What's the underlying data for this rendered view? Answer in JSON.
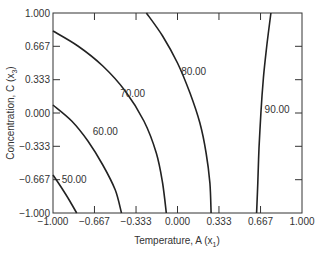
{
  "chart_data": {
    "type": "contour",
    "title": "",
    "xlabel": "Temperature, A (x",
    "xlabel_sub": "1",
    "xlabel_end": ")",
    "ylabel": "Concentration, C (x",
    "ylabel_sub": "3",
    "ylabel_end": ")",
    "xlim": [
      -1.0,
      1.0
    ],
    "ylim": [
      -1.0,
      1.0
    ],
    "x_ticks": [
      -1.0,
      -0.667,
      -0.333,
      0.0,
      0.333,
      0.667,
      1.0
    ],
    "x_tick_labels": [
      "−1.000",
      "−0.667",
      "−0.333",
      "0.000",
      "0.333",
      "0.667",
      "1.000"
    ],
    "y_ticks": [
      -1.0,
      -0.667,
      -0.333,
      0.0,
      0.333,
      0.667,
      1.0
    ],
    "y_tick_labels": [
      "−1.000",
      "−0.667",
      "−0.333",
      "0.000",
      "0.333",
      "0.667",
      "1.000"
    ],
    "grid": false,
    "contours": [
      {
        "level": 50,
        "label": "50.00",
        "points": [
          [
            -1.0,
            -0.62
          ],
          [
            -0.93,
            -0.75
          ],
          [
            -0.87,
            -0.87
          ],
          [
            -0.81,
            -1.0
          ]
        ],
        "label_pos": [
          -0.83,
          -0.66
        ]
      },
      {
        "level": 60,
        "label": "60.00",
        "points": [
          [
            -1.0,
            0.08
          ],
          [
            -0.85,
            -0.08
          ],
          [
            -0.72,
            -0.28
          ],
          [
            -0.6,
            -0.52
          ],
          [
            -0.5,
            -0.77
          ],
          [
            -0.45,
            -1.0
          ]
        ],
        "label_pos": [
          -0.58,
          -0.18
        ]
      },
      {
        "level": 70,
        "label": "70.00",
        "points": [
          [
            -1.0,
            0.82
          ],
          [
            -0.8,
            0.67
          ],
          [
            -0.6,
            0.47
          ],
          [
            -0.42,
            0.22
          ],
          [
            -0.27,
            -0.08
          ],
          [
            -0.17,
            -0.4
          ],
          [
            -0.12,
            -0.7
          ],
          [
            -0.09,
            -1.0
          ]
        ],
        "label_pos": [
          -0.36,
          0.2
        ]
      },
      {
        "level": 80,
        "label": "80.00",
        "points": [
          [
            -0.25,
            1.0
          ],
          [
            -0.12,
            0.77
          ],
          [
            0.0,
            0.5
          ],
          [
            0.1,
            0.2
          ],
          [
            0.18,
            -0.1
          ],
          [
            0.23,
            -0.4
          ],
          [
            0.26,
            -0.7
          ],
          [
            0.27,
            -1.0
          ]
        ],
        "label_pos": [
          0.13,
          0.42
        ]
      },
      {
        "level": 90,
        "label": "90.00",
        "points": [
          [
            0.75,
            1.0
          ],
          [
            0.72,
            0.7
          ],
          [
            0.69,
            0.35
          ],
          [
            0.67,
            0.0
          ],
          [
            0.655,
            -0.35
          ],
          [
            0.645,
            -0.7
          ],
          [
            0.635,
            -1.0
          ]
        ],
        "label_pos": [
          0.8,
          0.04
        ]
      }
    ]
  }
}
